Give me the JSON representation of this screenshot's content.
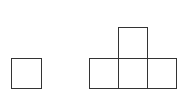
{
  "diagram": {
    "stroke_color": "#333333",
    "fill_color": "#ffffff",
    "shapes": [
      {
        "name": "single-square",
        "x": 11,
        "y": 58,
        "w": 31,
        "h": 31
      },
      {
        "name": "t-top-square",
        "x": 118,
        "y": 27,
        "w": 30,
        "h": 31
      },
      {
        "name": "t-bottom-left-square",
        "x": 89,
        "y": 58,
        "w": 30,
        "h": 31
      },
      {
        "name": "t-bottom-middle-square",
        "x": 118,
        "y": 58,
        "w": 30,
        "h": 31
      },
      {
        "name": "t-bottom-right-square",
        "x": 147,
        "y": 58,
        "w": 30,
        "h": 31
      }
    ]
  }
}
